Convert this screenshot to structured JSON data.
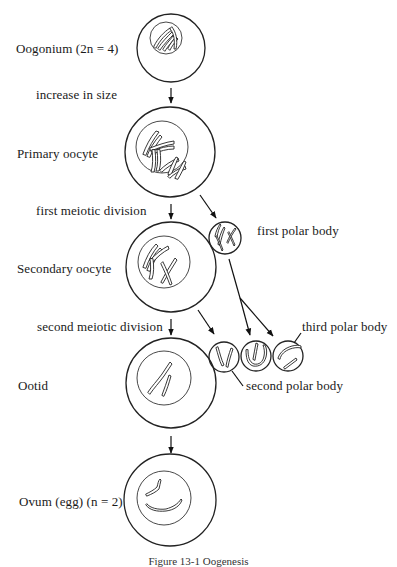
{
  "figure": {
    "type": "oogenesis diagram",
    "stages": [
      {
        "id": "oogonium",
        "label": "Oogonium (2n = 4)"
      },
      {
        "id": "primary-oocyte",
        "label": "Primary oocyte"
      },
      {
        "id": "secondary-oocyte",
        "label": "Secondary oocyte"
      },
      {
        "id": "ootid",
        "label": "Ootid"
      },
      {
        "id": "ovum",
        "label": "Ovum (egg) (n = 2)"
      }
    ],
    "transitions": [
      {
        "label": "increase in size"
      },
      {
        "label": "first meiotic division"
      },
      {
        "label": "second meiotic division"
      }
    ],
    "polar_bodies": [
      {
        "id": "first",
        "label": "first polar body"
      },
      {
        "id": "second",
        "label": "second polar body"
      },
      {
        "id": "third",
        "label": "third polar body"
      }
    ],
    "caption": "Figure 13-1   Oogenesis"
  },
  "colors": {
    "stroke": "#222222",
    "background": "#ffffff"
  }
}
